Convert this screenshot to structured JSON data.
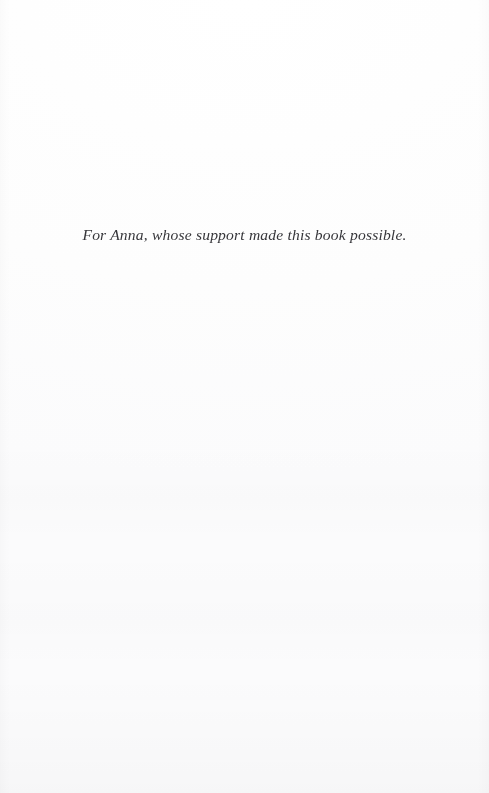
{
  "page": {
    "kind": "book-dedication-page",
    "paper_color": "#fefefe",
    "ink_color": "#2a2a2e"
  },
  "dedication": {
    "text": "For Anna, whose support made this book possible."
  }
}
